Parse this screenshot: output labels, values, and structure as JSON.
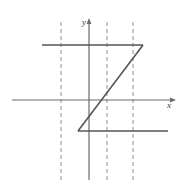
{
  "figure": {
    "title": "",
    "width": 183,
    "height": 188,
    "background_color": "#ffffff"
  },
  "chart_data": {
    "type": "line",
    "title": "",
    "xlabel": "x",
    "ylabel": "y",
    "grid": true,
    "legend": "none",
    "axes": {
      "x_axis": {
        "label": "x",
        "pixel_y": 100,
        "pixel_x_start": 12,
        "pixel_x_end": 172,
        "arrow": "right",
        "color": "#6b6b6b"
      },
      "y_axis": {
        "label": "y",
        "pixel_x": 89,
        "pixel_y_start": 22,
        "pixel_y_end": 180,
        "arrow": "up",
        "color": "#6b6b6b"
      }
    },
    "gridlines": {
      "style": "dashed",
      "orientation": "vertical",
      "color": "#8c8c8c",
      "pixel_x_positions": [
        61,
        107,
        133
      ],
      "pixel_y_start": 22,
      "pixel_y_end": 180
    },
    "segments": [
      {
        "name": "upper-horizontal-segment",
        "type": "horizontal",
        "pixel_x1": 42,
        "pixel_y1": 45,
        "pixel_x2": 143,
        "pixel_y2": 45,
        "color": "#555555"
      },
      {
        "name": "diagonal-segment",
        "type": "diagonal",
        "pixel_x1": 78,
        "pixel_y1": 131,
        "pixel_x2": 143,
        "pixel_y2": 45,
        "color": "#555555"
      },
      {
        "name": "lower-horizontal-segment",
        "type": "horizontal",
        "pixel_x1": 78,
        "pixel_y1": 131,
        "pixel_x2": 168,
        "pixel_y2": 131,
        "color": "#555555"
      }
    ],
    "labels": {
      "x_label_text": "x",
      "x_label_pixel_x": 167,
      "x_label_pixel_y": 108,
      "y_label_text": "y",
      "y_label_pixel_x": 82,
      "y_label_pixel_y": 25
    },
    "colors": {
      "curve": "#555555",
      "axis": "#6b6b6b",
      "grid": "#8c8c8c",
      "label": "#3b3b3b",
      "background": "#ffffff"
    }
  }
}
